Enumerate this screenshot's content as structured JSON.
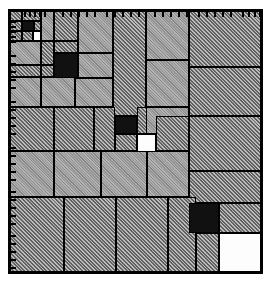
{
  "figure": {
    "type": "mosaic-treemap",
    "title": "",
    "background_color": "#ffffff",
    "frame_color": "#000000",
    "frame": {
      "x": 8,
      "y": 9,
      "width": 255,
      "height": 265
    }
  },
  "legend": {
    "fills": [
      {
        "key": "fine",
        "label": "fine-hatch-gray",
        "color": "#949494"
      },
      {
        "key": "coarse",
        "label": "coarse-hatch-gray",
        "color": "#8a8a8a"
      },
      {
        "key": "black",
        "label": "solid-black",
        "color": "#111111"
      },
      {
        "key": "white",
        "label": "solid-white",
        "color": "#fdfdfd"
      }
    ]
  },
  "axes": {
    "top": {
      "label": "",
      "tick_positions": [
        14,
        19,
        24,
        29,
        34,
        52,
        60,
        68,
        76,
        84,
        96,
        104,
        112,
        120,
        128,
        144,
        152,
        160,
        168,
        176,
        188,
        196,
        204,
        212,
        220,
        232,
        238,
        244,
        249
      ]
    },
    "left": {
      "label": "",
      "tick_positions": [
        10,
        15,
        20,
        25,
        30,
        44,
        52,
        60,
        68,
        76,
        90,
        98,
        106,
        114,
        122,
        136,
        144,
        152,
        160,
        168,
        180,
        188,
        196,
        204,
        212,
        224,
        232,
        240,
        248,
        256
      ]
    }
  },
  "chart_data": {
    "type": "treemap",
    "title": "",
    "xlabel": "",
    "ylabel": "",
    "units": "pixels",
    "cells": [
      {
        "id": "c01",
        "x": 0,
        "y": 0,
        "w": 12,
        "h": 10,
        "fill": "coarse"
      },
      {
        "id": "c02",
        "x": 12,
        "y": 0,
        "w": 19,
        "h": 10,
        "fill": "coarse"
      },
      {
        "id": "c03",
        "x": 0,
        "y": 10,
        "w": 12,
        "h": 10,
        "fill": "coarse"
      },
      {
        "id": "c04",
        "x": 12,
        "y": 10,
        "w": 12,
        "h": 10,
        "fill": "black"
      },
      {
        "id": "c05",
        "x": 24,
        "y": 10,
        "w": 7,
        "h": 10,
        "fill": "coarse"
      },
      {
        "id": "c06",
        "x": 0,
        "y": 20,
        "w": 12,
        "h": 10,
        "fill": "coarse"
      },
      {
        "id": "c07",
        "x": 12,
        "y": 20,
        "w": 11,
        "h": 10,
        "fill": "coarse"
      },
      {
        "id": "c08",
        "x": 23,
        "y": 20,
        "w": 8,
        "h": 10,
        "fill": "white"
      },
      {
        "id": "c09",
        "x": 31,
        "y": 0,
        "w": 13,
        "h": 30,
        "fill": "fine"
      },
      {
        "id": "c10",
        "x": 44,
        "y": 0,
        "w": 24,
        "h": 30,
        "fill": "coarse"
      },
      {
        "id": "c11",
        "x": 68,
        "y": 0,
        "w": 35,
        "h": 42,
        "fill": "fine"
      },
      {
        "id": "c12",
        "x": 103,
        "y": 0,
        "w": 33,
        "h": 105,
        "fill": "coarse"
      },
      {
        "id": "c13",
        "x": 136,
        "y": 0,
        "w": 43,
        "h": 49,
        "fill": "fine"
      },
      {
        "id": "c14",
        "x": 179,
        "y": 0,
        "w": 72,
        "h": 56,
        "fill": "coarse"
      },
      {
        "id": "c15",
        "x": 0,
        "y": 30,
        "w": 31,
        "h": 24,
        "fill": "fine"
      },
      {
        "id": "c16",
        "x": 31,
        "y": 30,
        "w": 13,
        "h": 24,
        "fill": "coarse"
      },
      {
        "id": "c17",
        "x": 44,
        "y": 30,
        "w": 24,
        "h": 12,
        "fill": "coarse"
      },
      {
        "id": "c18",
        "x": 44,
        "y": 42,
        "w": 24,
        "h": 25,
        "fill": "black"
      },
      {
        "id": "c19",
        "x": 68,
        "y": 42,
        "w": 35,
        "h": 25,
        "fill": "fine"
      },
      {
        "id": "c20",
        "x": 136,
        "y": 49,
        "w": 43,
        "h": 47,
        "fill": "fine"
      },
      {
        "id": "c21",
        "x": 179,
        "y": 56,
        "w": 72,
        "h": 49,
        "fill": "coarse"
      },
      {
        "id": "c22",
        "x": 0,
        "y": 54,
        "w": 31,
        "h": 12,
        "fill": "coarse"
      },
      {
        "id": "c23",
        "x": 31,
        "y": 54,
        "w": 13,
        "h": 12,
        "fill": "coarse"
      },
      {
        "id": "c24",
        "x": 0,
        "y": 66,
        "w": 31,
        "h": 30,
        "fill": "fine"
      },
      {
        "id": "c25",
        "x": 31,
        "y": 66,
        "w": 34,
        "h": 30,
        "fill": "fine"
      },
      {
        "id": "c26",
        "x": 65,
        "y": 67,
        "w": 38,
        "h": 29,
        "fill": "fine"
      },
      {
        "id": "c27",
        "x": 0,
        "y": 96,
        "w": 44,
        "h": 44,
        "fill": "coarse"
      },
      {
        "id": "c28",
        "x": 44,
        "y": 96,
        "w": 40,
        "h": 44,
        "fill": "coarse"
      },
      {
        "id": "c29",
        "x": 84,
        "y": 96,
        "w": 21,
        "h": 44,
        "fill": "coarse"
      },
      {
        "id": "c30",
        "x": 105,
        "y": 105,
        "w": 22,
        "h": 18,
        "fill": "black"
      },
      {
        "id": "c31",
        "x": 105,
        "y": 123,
        "w": 22,
        "h": 17,
        "fill": "coarse"
      },
      {
        "id": "c32",
        "x": 127,
        "y": 96,
        "w": 14,
        "h": 27,
        "fill": "coarse"
      },
      {
        "id": "c33",
        "x": 127,
        "y": 123,
        "w": 19,
        "h": 19,
        "fill": "white"
      },
      {
        "id": "c34",
        "x": 136,
        "y": 96,
        "w": 43,
        "h": 27,
        "fill": "fine"
      },
      {
        "id": "c35",
        "x": 146,
        "y": 105,
        "w": 33,
        "h": 35,
        "fill": "coarse"
      },
      {
        "id": "c36",
        "x": 179,
        "y": 105,
        "w": 72,
        "h": 55,
        "fill": "coarse"
      },
      {
        "id": "c37",
        "x": 0,
        "y": 140,
        "w": 44,
        "h": 46,
        "fill": "fine"
      },
      {
        "id": "c38",
        "x": 44,
        "y": 140,
        "w": 47,
        "h": 46,
        "fill": "fine"
      },
      {
        "id": "c39",
        "x": 91,
        "y": 140,
        "w": 46,
        "h": 46,
        "fill": "fine"
      },
      {
        "id": "c40",
        "x": 137,
        "y": 140,
        "w": 42,
        "h": 46,
        "fill": "fine"
      },
      {
        "id": "c41",
        "x": 179,
        "y": 160,
        "w": 72,
        "h": 32,
        "fill": "coarse"
      },
      {
        "id": "c42",
        "x": 0,
        "y": 186,
        "w": 54,
        "h": 75,
        "fill": "coarse"
      },
      {
        "id": "c43",
        "x": 54,
        "y": 186,
        "w": 52,
        "h": 75,
        "fill": "coarse"
      },
      {
        "id": "c44",
        "x": 106,
        "y": 186,
        "w": 52,
        "h": 75,
        "fill": "coarse"
      },
      {
        "id": "c45",
        "x": 158,
        "y": 186,
        "w": 28,
        "h": 75,
        "fill": "coarse"
      },
      {
        "id": "c46",
        "x": 179,
        "y": 192,
        "w": 30,
        "h": 30,
        "fill": "black"
      },
      {
        "id": "c47",
        "x": 209,
        "y": 192,
        "w": 42,
        "h": 30,
        "fill": "coarse"
      },
      {
        "id": "c48",
        "x": 186,
        "y": 222,
        "w": 23,
        "h": 39,
        "fill": "coarse"
      },
      {
        "id": "c49",
        "x": 209,
        "y": 222,
        "w": 42,
        "h": 39,
        "fill": "white"
      }
    ]
  }
}
